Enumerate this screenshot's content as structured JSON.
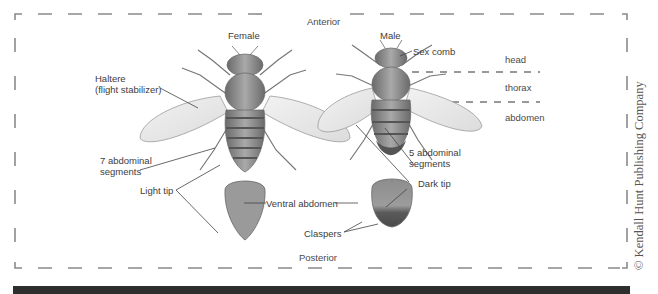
{
  "figure": {
    "orientation": {
      "top": "Anterior",
      "bottom": "Posterior"
    },
    "columns": {
      "female": "Female",
      "male": "Male"
    },
    "body_regions": [
      "head",
      "thorax",
      "abdomen"
    ],
    "female_labels": {
      "haltere_line1": "Haltere",
      "haltere_line2": "(flight stabilizer)",
      "segments_line1": "7 abdominal",
      "segments_line2": "segments",
      "tip": "Light tip"
    },
    "male_labels": {
      "sex_comb": "Sex comb",
      "segments_line1": "5 abdominal",
      "segments_line2": "segments",
      "tip": "Dark tip",
      "claspers": "Claspers"
    },
    "center_labels": {
      "ventral": "Ventral abdomen"
    },
    "copyright": "© Kendall Hunt Publishing Company"
  },
  "colors": {
    "border_dash": "#8a8a8a",
    "body_dark": "#6b6b6b",
    "body_mid": "#9a9a9a",
    "wing": "#e6e6e6",
    "bar": "#2e2e2e"
  }
}
